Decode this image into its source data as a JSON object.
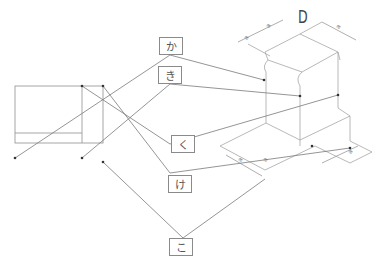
{
  "labels": {
    "ka": "か",
    "ki": "き",
    "ku": "く",
    "ke": "け",
    "ko": "こ"
  },
  "dimensions": {
    "top": "D",
    "top_left_a": "a",
    "top_left_b": "a",
    "top_right": "a",
    "bottom_left_a": "a",
    "bottom_left_b": "a",
    "bottom_right": "a"
  },
  "colors": {
    "line": "#8a8a8a",
    "leader": "#6e6e6e",
    "box_border": "#8a8a8a",
    "text": "#555555"
  }
}
